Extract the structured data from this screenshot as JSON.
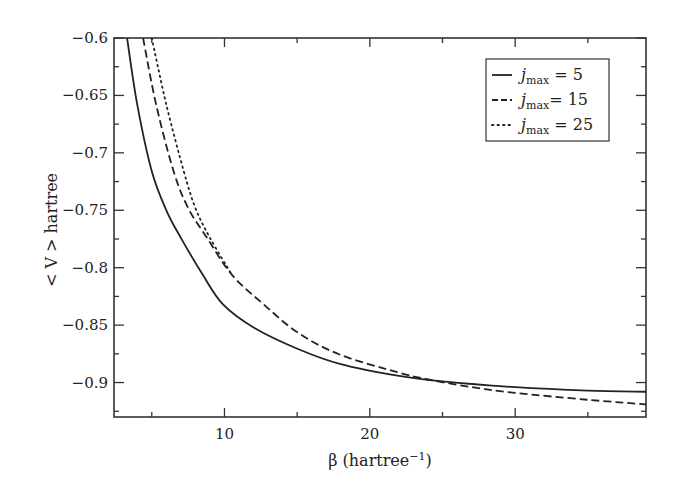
{
  "chart_data": {
    "type": "line",
    "title": "",
    "xlabel": "β (hartree⁻¹)",
    "xlabel_base": "β (hartree",
    "xlabel_sup": "−1",
    "xlabel_close": ")",
    "ylabel": "< V > hartree",
    "xlim": [
      2.4,
      39.0
    ],
    "ylim": [
      -0.93,
      -0.6
    ],
    "x_ticks_major": [
      10,
      20,
      30
    ],
    "x_ticks_minor": [
      5,
      15,
      25,
      35
    ],
    "y_ticks_major": [
      -0.6,
      -0.65,
      -0.7,
      -0.75,
      -0.8,
      -0.85,
      -0.9
    ],
    "y_tick_labels": [
      "−0.6",
      "−0.65",
      "−0.7",
      "−0.75",
      "−0.8",
      "−0.85",
      "−0.9"
    ],
    "y_ticks_minor": [
      -0.625,
      -0.675,
      -0.725,
      -0.775,
      -0.825,
      -0.875,
      -0.925
    ],
    "grid": false,
    "legend_position": "upper right",
    "series": [
      {
        "name": "j_max = 5",
        "label_prefix": "j",
        "label_sub": "max",
        "label_suffix": " = 5",
        "style": "solid",
        "x": [
          3.3,
          4.0,
          5.0,
          6.0,
          7.0,
          8.5,
          9.9,
          12.0,
          15.1,
          18.0,
          21.9,
          25.0,
          30.0,
          35.0,
          39.0
        ],
        "y": [
          -0.6,
          -0.658,
          -0.716,
          -0.75,
          -0.774,
          -0.806,
          -0.832,
          -0.852,
          -0.871,
          -0.884,
          -0.894,
          -0.899,
          -0.904,
          -0.907,
          -0.908
        ]
      },
      {
        "name": "j_max = 15",
        "label_prefix": "j",
        "label_sub": "max",
        "label_suffix": "= 15",
        "style": "dashed",
        "x": [
          4.4,
          5.3,
          6.5,
          7.5,
          8.8,
          10.5,
          12.7,
          15.1,
          18.0,
          21.9,
          23.7,
          27.0,
          30.0,
          35.0,
          39.0
        ],
        "y": [
          -0.6,
          -0.658,
          -0.716,
          -0.748,
          -0.774,
          -0.806,
          -0.832,
          -0.857,
          -0.876,
          -0.891,
          -0.8965,
          -0.904,
          -0.909,
          -0.915,
          -0.919
        ]
      },
      {
        "name": "j_max = 25",
        "label_prefix": "j",
        "label_sub": "max",
        "label_suffix": " = 25",
        "style": "dotted",
        "x": [
          5.0,
          6.0,
          7.2,
          8.0,
          9.0,
          10.5
        ],
        "y": [
          -0.6,
          -0.658,
          -0.716,
          -0.748,
          -0.774,
          -0.806
        ]
      }
    ]
  }
}
